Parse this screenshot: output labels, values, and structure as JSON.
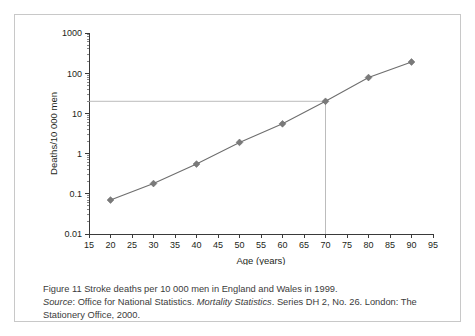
{
  "figure": {
    "caption_line1": "Figure 11  Stroke deaths per 10 000 men in England and Wales in 1999.",
    "source_label": "Source",
    "source_text_a": ": Office for National Statistics. ",
    "source_italic": "Mortality Statistics",
    "source_text_b": ". Series DH 2, No. 26. London: The Stationery Office, 2000."
  },
  "chart_data": {
    "type": "line",
    "title": "",
    "xlabel": "Age (years)",
    "ylabel": "Deaths/10 000 men",
    "x": [
      20,
      30,
      40,
      50,
      60,
      70,
      80,
      90
    ],
    "values": [
      0.07,
      0.18,
      0.55,
      1.9,
      5.5,
      20,
      78,
      190
    ],
    "series": [
      {
        "name": "Stroke deaths per 10 000 men",
        "values": [
          0.07,
          0.18,
          0.55,
          1.9,
          5.5,
          20,
          78,
          190
        ]
      }
    ],
    "xlim": [
      15,
      95
    ],
    "ylim": [
      0.01,
      1000
    ],
    "yscale": "log",
    "xscale": "linear",
    "xticks": [
      15,
      20,
      25,
      30,
      35,
      40,
      45,
      50,
      55,
      60,
      65,
      70,
      75,
      80,
      85,
      90,
      95
    ],
    "xticklabels": [
      "15",
      "20",
      "25",
      "30",
      "35",
      "40",
      "45",
      "50",
      "55",
      "60",
      "65",
      "70",
      "75",
      "80",
      "85",
      "90",
      "95"
    ],
    "yticks": [
      0.01,
      0.1,
      1,
      10,
      100,
      1000
    ],
    "yticklabels": [
      "0.01",
      "0.1",
      "1",
      "10",
      "100",
      "1000"
    ],
    "grid": false,
    "legend": "none",
    "annotations": [
      {
        "type": "reference-lines",
        "x": 70,
        "y": 20,
        "description": "Dashed guide lines from y-axis to the age 70 data point and down to the x-axis"
      }
    ],
    "marker": "diamond",
    "line_color": "#6e6e6e",
    "marker_color": "#7a7a7a",
    "reference_line_color": "#b4b4b4"
  }
}
